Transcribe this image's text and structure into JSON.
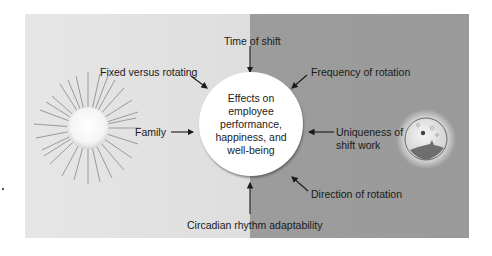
{
  "diagram": {
    "center": {
      "lines": [
        "Effects on",
        "employee",
        "performance,",
        "happiness, and",
        "well-being"
      ]
    },
    "factors": {
      "time_of_shift": "Time of shift",
      "fixed_vs_rotating": "Fixed versus rotating",
      "frequency_of_rotation": "Frequency of rotation",
      "family": "Family",
      "uniqueness_line1": "Uniqueness of",
      "uniqueness_line2": "shift work",
      "direction_of_rotation": "Direction of rotation",
      "circadian": "Circadian rhythm adaptability"
    },
    "icons": {
      "left": "sun-icon",
      "right": "moon-icon"
    },
    "colors": {
      "day_background": "#e2e2e2",
      "night_background": "#9b9b9b",
      "center_fill": "#ffffff",
      "text": "#1a1a1a"
    }
  }
}
